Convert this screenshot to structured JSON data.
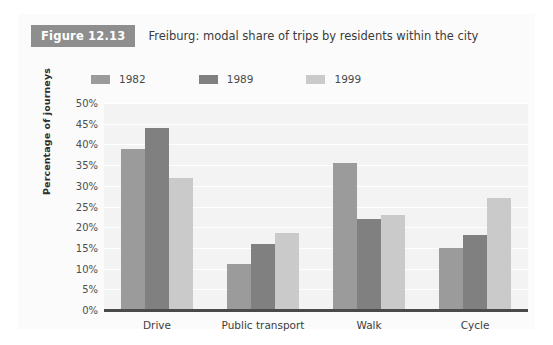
{
  "figure": {
    "badge": "Figure 12.13",
    "title": "Freiburg: modal share of trips by residents within the city"
  },
  "chart_data": {
    "type": "bar",
    "title": "Freiburg: modal share of trips by residents within the city",
    "xlabel": "",
    "ylabel": "Percentage of journeys",
    "ylim": [
      0,
      50
    ],
    "ytick_step": 5,
    "ytick_labels": [
      "50%",
      "45%",
      "40%",
      "35%",
      "30%",
      "25%",
      "20%",
      "15%",
      "10%",
      "5%",
      "0%"
    ],
    "grid": true,
    "legend_position": "top-left",
    "categories": [
      "Drive",
      "Public transport",
      "Walk",
      "Cycle"
    ],
    "series": [
      {
        "name": "1982",
        "color": "#9b9b9b",
        "values": [
          39,
          11,
          35.5,
          15
        ]
      },
      {
        "name": "1989",
        "color": "#808080",
        "values": [
          44,
          16,
          22,
          18
        ]
      },
      {
        "name": "1999",
        "color": "#cacaca",
        "values": [
          32,
          18.5,
          23,
          27
        ]
      }
    ]
  }
}
